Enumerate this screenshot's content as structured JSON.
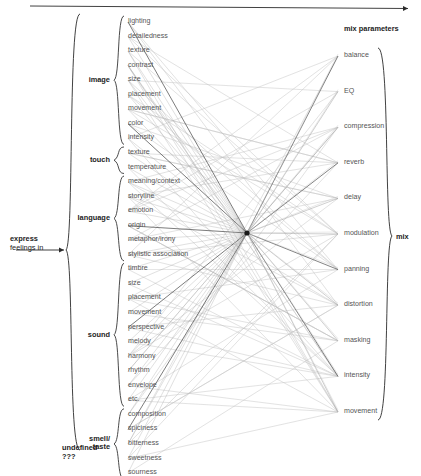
{
  "diagram": {
    "top_arrow": {
      "name": "process-direction-arrow"
    },
    "source": {
      "line1": "express",
      "line2": "feelings in"
    },
    "right_header": "mix parameters",
    "right_group_label": "mix",
    "undefined_label": {
      "line1": "undefined",
      "line2": "???"
    },
    "hub": {
      "name": "convergence-node"
    }
  },
  "left_groups": [
    {
      "label": "image",
      "items": [
        "lighting",
        "detailedness",
        "texture",
        "contrast",
        "size",
        "placement",
        "movement",
        "color",
        "intensity"
      ]
    },
    {
      "label": "touch",
      "items": [
        "texture",
        "temperature"
      ]
    },
    {
      "label": "language",
      "items": [
        "meaning/context",
        "storyline",
        "emotion",
        "origin",
        "metaphor/irony",
        "stylistic association"
      ]
    },
    {
      "label": "sound",
      "items": [
        "timbre",
        "size",
        "placement",
        "movement",
        "perspective",
        "melody",
        "harmony",
        "rhythm",
        "envelope",
        "etc."
      ]
    },
    {
      "label": "smell/\ntaste",
      "items": [
        "composition",
        "spiciness",
        "bitterness",
        "sweetness",
        "sourness"
      ]
    }
  ],
  "right_items": [
    "balance",
    "EQ",
    "compression",
    "reverb",
    "delay",
    "modulation",
    "panning",
    "distortion",
    "masking",
    "intensity",
    "movement"
  ],
  "colors": {
    "line_light": "#c3c3c3",
    "line_mid": "#9a9a9a",
    "line_dark": "#4a4a4a",
    "text": "#555555",
    "heading": "#1d1d1d",
    "bracket": "#2b2b2b"
  },
  "geometry": {
    "left_x": 126,
    "right_x": 342,
    "left_top_y": 22,
    "left_step": 14.55,
    "right_top_y": 56,
    "right_step": 35.6,
    "hub_x": 247,
    "hub_y": 233
  }
}
